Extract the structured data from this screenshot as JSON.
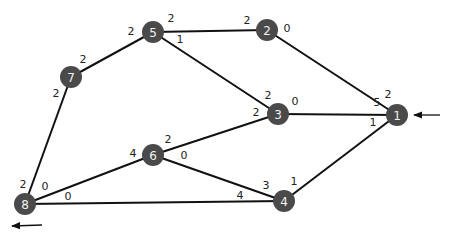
{
  "diagram": {
    "type": "weighted-graph",
    "nodes": [
      {
        "id": "1",
        "label": "1",
        "x": 397,
        "y": 115
      },
      {
        "id": "2",
        "label": "2",
        "x": 267,
        "y": 30
      },
      {
        "id": "3",
        "label": "3",
        "x": 278,
        "y": 114
      },
      {
        "id": "4",
        "label": "4",
        "x": 284,
        "y": 201
      },
      {
        "id": "5",
        "label": "5",
        "x": 153,
        "y": 32
      },
      {
        "id": "6",
        "label": "6",
        "x": 153,
        "y": 155
      },
      {
        "id": "7",
        "label": "7",
        "x": 71,
        "y": 77
      },
      {
        "id": "8",
        "label": "8",
        "x": 25,
        "y": 204
      }
    ],
    "edges": [
      {
        "from": "5",
        "to": "2"
      },
      {
        "from": "5",
        "to": "7"
      },
      {
        "from": "5",
        "to": "3"
      },
      {
        "from": "2",
        "to": "1"
      },
      {
        "from": "7",
        "to": "8"
      },
      {
        "from": "3",
        "to": "1"
      },
      {
        "from": "3",
        "to": "6"
      },
      {
        "from": "1",
        "to": "4"
      },
      {
        "from": "6",
        "to": "8"
      },
      {
        "from": "6",
        "to": "4"
      },
      {
        "from": "8",
        "to": "4"
      }
    ],
    "labels": [
      {
        "text": "2",
        "x": 131,
        "y": 31
      },
      {
        "text": "2",
        "x": 171,
        "y": 18
      },
      {
        "text": "1",
        "x": 180,
        "y": 39
      },
      {
        "text": "2",
        "x": 247,
        "y": 20
      },
      {
        "text": "0",
        "x": 287,
        "y": 28
      },
      {
        "text": "2",
        "x": 83,
        "y": 59
      },
      {
        "text": "2",
        "x": 56,
        "y": 93
      },
      {
        "text": "2",
        "x": 268,
        "y": 95
      },
      {
        "text": "2",
        "x": 256,
        "y": 112
      },
      {
        "text": "0",
        "x": 295,
        "y": 101
      },
      {
        "text": "5",
        "x": 377,
        "y": 102
      },
      {
        "text": "2",
        "x": 388,
        "y": 94
      },
      {
        "text": "1",
        "x": 373,
        "y": 122
      },
      {
        "text": "4",
        "x": 133,
        "y": 153
      },
      {
        "text": "2",
        "x": 168,
        "y": 139
      },
      {
        "text": "0",
        "x": 184,
        "y": 155
      },
      {
        "text": "3",
        "x": 266,
        "y": 185
      },
      {
        "text": "1",
        "x": 294,
        "y": 181
      },
      {
        "text": "4",
        "x": 240,
        "y": 195
      },
      {
        "text": "2",
        "x": 23,
        "y": 184
      },
      {
        "text": "0",
        "x": 45,
        "y": 186
      },
      {
        "text": "0",
        "x": 68,
        "y": 196
      }
    ],
    "arrows": [
      {
        "name": "incoming-arrow",
        "x1": 440,
        "y1": 115,
        "x2": 414,
        "y2": 115
      },
      {
        "name": "outgoing-arrow",
        "x1": 42,
        "y1": 225,
        "x2": 12,
        "y2": 226
      }
    ]
  }
}
